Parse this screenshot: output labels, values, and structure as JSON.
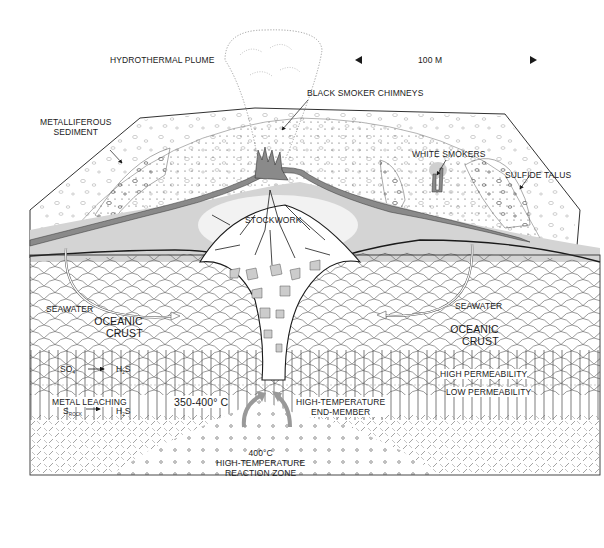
{
  "figure": {
    "type": "cross-section diagram"
  },
  "scale_bar": {
    "label": "100 M"
  },
  "labels": {
    "plume": "HYDROTHERMAL PLUME",
    "black_smokers": "BLACK SMOKER CHIMNEYS",
    "metalliferous_1": "METALLIFEROUS",
    "metalliferous_2": "SEDIMENT",
    "white_smokers": "WHITE SMOKERS",
    "sulfide_talus": "SULFIDE TALUS",
    "stockwork": "STOCKWORK",
    "seawater_left": "SEAWATER",
    "seawater_right": "SEAWATER",
    "oceanic_left_1": "OCEANIC",
    "oceanic_left_2": "CRUST",
    "oceanic_right_1": "OCEANIC",
    "oceanic_right_2": "CRUST",
    "so4": "SO",
    "so4_sub": "4",
    "h2s_1": "H",
    "h2s_1_sub": "2",
    "h2s_1_tail": "S",
    "metal_leaching": "METAL LEACHING",
    "s_rock": "S",
    "s_rock_sub": "ROCK",
    "h2s_2": "H",
    "h2s_2_sub": "2",
    "h2s_2_tail": "S",
    "temp_range": "350-400° C",
    "end_member_1": "HIGH-TEMPERATURE",
    "end_member_2": "END-MEMBER",
    "high_perm": "HIGH PERMEABILITY",
    "low_perm": "LOW PERMEABILITY",
    "reaction_temp": "400°C",
    "reaction_1": "HIGH-TEMPERATURE",
    "reaction_2": "REACTION ZONE"
  },
  "colors": {
    "line": "#1a1a1a",
    "mound_gray": "#8a8a8a",
    "halo_gray": "#d4d4d4",
    "clast_gray": "#c8c8c8",
    "pattern_line": "#555555"
  }
}
